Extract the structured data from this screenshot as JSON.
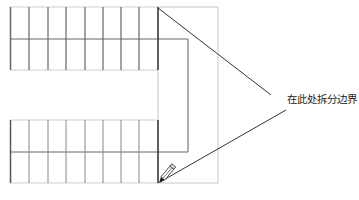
{
  "diagram": {
    "type": "stair-plan-annotation",
    "annotation": {
      "text": "在此处拆分边界"
    },
    "upper_flight": {
      "treads": 8,
      "rows": 2
    },
    "lower_flight": {
      "treads": 8,
      "rows": 2
    },
    "landing": {
      "outline": "rectangle"
    },
    "icons": [
      "pencil-icon"
    ],
    "colors": {
      "background": "#ffffff",
      "stair_lines": "#555555",
      "landing_outline": "#c8c8c8",
      "inner_boundary": "#777777",
      "leader_lines": "#333333",
      "text": "#222222"
    }
  }
}
